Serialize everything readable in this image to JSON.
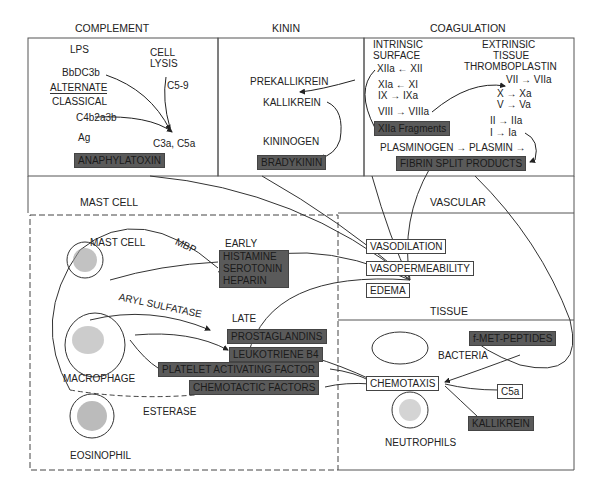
{
  "sections": {
    "complement": "COMPLEMENT",
    "kinin": "KININ",
    "coagulation": "COAGULATION",
    "mast_cell": "MAST CELL",
    "vascular": "VASCULAR",
    "tissue": "TISSUE"
  },
  "complement": {
    "lps": "LPS",
    "bbdc3b": "BbDC3b",
    "alternate": "ALTERNATE",
    "classical": "CLASSICAL",
    "c4b2a3b": "C4b2a3b",
    "ag": "Ag",
    "cell": "CELL",
    "lysis": "LYSIS",
    "c59": "C5-9",
    "c3a_c5a": "C3a, C5a",
    "anaphylatoxin": "ANAPHYLATOXIN"
  },
  "kinin": {
    "prekallikrein": "PREKALLIKREIN",
    "kallikrein": "KALLIKREIN",
    "kininogen": "KININOGEN",
    "bradykinin": "BRADYKININ"
  },
  "coagulation": {
    "intrinsic": "INTRINSIC",
    "surface": "SURFACE",
    "xiia_xii": "XIIa ← XII",
    "xia_xi": "XIa ← XI",
    "ix_ixa": "IX → IXa",
    "viii_viiia": "VIII → VIIIa",
    "xiia_fragments": "XIIa Fragments",
    "extrinsic": "EXTRINSIC",
    "tissue": "TISSUE",
    "thromboplastin": "THROMBOPLASTIN",
    "vii_viia": "VII → VIIa",
    "x_xa": "X → Xa",
    "v_va": "V → Va",
    "ii_iia": "II → IIa",
    "i_ia": "I → Ia",
    "plasminogen": "PLASMINOGEN → PLASMIN →",
    "fibrin_split": "FIBRIN SPLIT PRODUCTS"
  },
  "mast": {
    "mast_cell_label": "MAST CELL",
    "mbp": "MBP",
    "early": "EARLY",
    "histamine": "HISTAMINE",
    "serotonin": "SEROTONIN",
    "heparin": "HEPARIN",
    "aryl_sulfatase": "ARYL SULFATASE",
    "late": "LATE",
    "prostaglandins": "PROSTAGLANDINS",
    "leukotriene": "LEUKOTRIENE B4",
    "paf": "PLATELET ACTIVATING FACTOR",
    "chemotactic": "CHEMOTACTIC FACTORS",
    "macrophage": "MACROPHAGE",
    "esterase": "ESTERASE",
    "eosinophil": "EOSINOPHIL"
  },
  "vascular": {
    "vasodilation": "VASODILATION",
    "vasopermeability": "VASOPERMEABILITY",
    "edema": "EDEMA"
  },
  "tissue": {
    "fmet": "f-MET-PEPTIDES",
    "bacteria": "BACTERIA",
    "chemotaxis": "CHEMOTAXIS",
    "c5a": "C5a",
    "kallikrein": "KALLIKREIN",
    "neutrophils": "NEUTROPHILS"
  },
  "colors": {
    "dark_box": "#5a5a5a",
    "line": "#333333"
  }
}
